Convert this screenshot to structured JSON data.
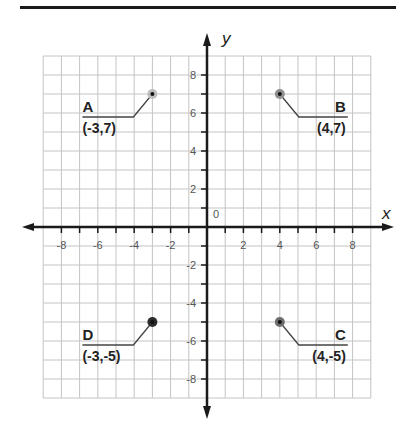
{
  "chart_data": {
    "type": "scatter",
    "title": "",
    "xlabel": "x",
    "ylabel": "y",
    "xlim": [
      -9,
      9
    ],
    "ylim": [
      -9,
      9
    ],
    "grid": true,
    "origin_label": "0",
    "x_tick_labels": [
      "-8",
      "-6",
      "-4",
      "-2",
      "2",
      "4",
      "6",
      "8"
    ],
    "x_tick_values": [
      -8,
      -6,
      -4,
      -2,
      2,
      4,
      6,
      8
    ],
    "y_tick_labels": [
      "8",
      "6",
      "4",
      "2",
      "-2",
      "-4",
      "-6",
      "-8"
    ],
    "y_tick_values": [
      8,
      6,
      4,
      2,
      -2,
      -4,
      -6,
      -8
    ],
    "points": [
      {
        "name": "A",
        "x": -3,
        "y": 7,
        "label": "(-3,7)",
        "halo": "#bdbdbd",
        "side": "left"
      },
      {
        "name": "B",
        "x": 4,
        "y": 7,
        "label": "(4,7)",
        "halo": "#8f8f8f",
        "side": "right"
      },
      {
        "name": "C",
        "x": 4,
        "y": -5,
        "label": "(4,-5)",
        "halo": "#6e6e6e",
        "side": "right"
      },
      {
        "name": "D",
        "x": -3,
        "y": -5,
        "label": "(-3,-5)",
        "halo": "#2a2a2a",
        "side": "left"
      }
    ]
  },
  "colors": {
    "grid": "#c4c4c4",
    "axis": "#1a1a1a",
    "leader": "#444444"
  }
}
